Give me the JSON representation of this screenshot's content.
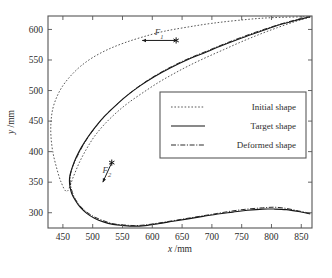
{
  "chart_data": {
    "type": "line",
    "title": "",
    "xlabel": "x /mm",
    "ylabel": "y /mm",
    "xlim": [
      425,
      868
    ],
    "ylim": [
      275,
      622
    ],
    "grid": false,
    "legend_position": "center-right",
    "xticks": [
      450,
      500,
      550,
      600,
      650,
      700,
      750,
      800,
      850
    ],
    "yticks": [
      300,
      350,
      400,
      450,
      500,
      550,
      600
    ],
    "xtick_labels": [
      "450",
      "500",
      "550",
      "600",
      "650",
      "700",
      "750",
      "800",
      "850"
    ],
    "ytick_labels": [
      "300",
      "350",
      "400",
      "450",
      "500",
      "550",
      "600"
    ],
    "series": [
      {
        "name": "Initial shape",
        "style": "dotted",
        "points": [
          [
            865,
            620
          ],
          [
            840,
            613
          ],
          [
            810,
            603
          ],
          [
            780,
            592
          ],
          [
            750,
            580
          ],
          [
            720,
            567
          ],
          [
            690,
            554
          ],
          [
            660,
            540
          ],
          [
            635,
            527
          ],
          [
            610,
            513
          ],
          [
            585,
            497
          ],
          [
            560,
            480
          ],
          [
            540,
            464
          ],
          [
            520,
            445
          ],
          [
            503,
            425
          ],
          [
            490,
            405
          ],
          [
            478,
            383
          ],
          [
            468,
            360
          ],
          [
            457,
            335
          ],
          [
            447,
            350
          ],
          [
            439,
            375
          ],
          [
            433,
            400
          ],
          [
            430,
            425
          ],
          [
            430,
            448
          ],
          [
            433,
            470
          ],
          [
            440,
            490
          ],
          [
            450,
            508
          ],
          [
            464,
            525
          ],
          [
            480,
            540
          ],
          [
            500,
            554
          ],
          [
            525,
            567
          ],
          [
            553,
            578
          ],
          [
            585,
            588
          ],
          [
            620,
            597
          ],
          [
            660,
            604
          ],
          [
            700,
            610
          ],
          [
            745,
            615
          ],
          [
            795,
            619
          ],
          [
            865,
            621
          ]
        ]
      },
      {
        "name": "Target shape",
        "style": "solid",
        "points": [
          [
            865,
            298
          ],
          [
            845,
            302
          ],
          [
            825,
            305
          ],
          [
            805,
            306
          ],
          [
            785,
            306
          ],
          [
            760,
            304
          ],
          [
            735,
            301
          ],
          [
            710,
            298
          ],
          [
            685,
            294
          ],
          [
            660,
            290
          ],
          [
            635,
            286
          ],
          [
            610,
            282
          ],
          [
            588,
            279
          ],
          [
            570,
            278
          ],
          [
            552,
            279
          ],
          [
            534,
            281
          ],
          [
            518,
            285
          ],
          [
            503,
            291
          ],
          [
            490,
            299
          ],
          [
            479,
            309
          ],
          [
            471,
            320
          ],
          [
            465,
            331
          ],
          [
            462,
            342
          ],
          [
            461,
            352
          ],
          [
            462,
            362
          ],
          [
            466,
            375
          ],
          [
            472,
            390
          ],
          [
            481,
            407
          ],
          [
            492,
            424
          ],
          [
            505,
            441
          ],
          [
            520,
            458
          ],
          [
            538,
            475
          ],
          [
            558,
            492
          ],
          [
            580,
            508
          ],
          [
            604,
            523
          ],
          [
            630,
            537
          ],
          [
            658,
            550
          ],
          [
            688,
            562
          ],
          [
            718,
            574
          ],
          [
            750,
            586
          ],
          [
            782,
            597
          ],
          [
            815,
            608
          ],
          [
            845,
            616
          ],
          [
            865,
            621
          ]
        ]
      },
      {
        "name": "Deformed shape",
        "style": "dashdot",
        "points": [
          [
            865,
            299
          ],
          [
            845,
            303
          ],
          [
            825,
            307
          ],
          [
            805,
            309
          ],
          [
            785,
            308
          ],
          [
            760,
            306
          ],
          [
            735,
            303
          ],
          [
            710,
            299
          ],
          [
            685,
            295
          ],
          [
            660,
            291
          ],
          [
            635,
            287
          ],
          [
            610,
            283
          ],
          [
            588,
            280
          ],
          [
            570,
            279
          ],
          [
            552,
            280
          ],
          [
            534,
            282
          ],
          [
            518,
            287
          ],
          [
            503,
            293
          ],
          [
            490,
            301
          ],
          [
            479,
            311
          ],
          [
            471,
            322
          ],
          [
            466,
            333
          ],
          [
            463,
            344
          ],
          [
            462,
            354
          ],
          [
            463,
            364
          ],
          [
            467,
            377
          ],
          [
            474,
            392
          ],
          [
            483,
            409
          ],
          [
            494,
            426
          ],
          [
            507,
            443
          ],
          [
            522,
            460
          ],
          [
            540,
            477
          ],
          [
            560,
            494
          ],
          [
            582,
            510
          ],
          [
            606,
            525
          ],
          [
            632,
            539
          ],
          [
            660,
            552
          ],
          [
            690,
            564
          ],
          [
            720,
            576
          ],
          [
            752,
            588
          ],
          [
            784,
            599
          ],
          [
            816,
            609
          ],
          [
            846,
            617
          ],
          [
            865,
            621
          ]
        ]
      }
    ],
    "annotations": [
      {
        "label": "F1",
        "label_sub": "1",
        "marker_x": 640,
        "marker_y": 582,
        "arrow_to_x": 583,
        "arrow_to_y": 582,
        "marker": "star"
      },
      {
        "label": "F2",
        "label_sub": "2",
        "marker_x": 532,
        "marker_y": 382,
        "arrow_to_x": 517,
        "arrow_to_y": 350,
        "marker": "star"
      }
    ]
  },
  "legend": {
    "items": [
      {
        "label": "Initial shape",
        "style": "dotted"
      },
      {
        "label": "Target shape",
        "style": "solid"
      },
      {
        "label": "Deformed shape",
        "style": "dashdot"
      }
    ]
  },
  "axes": {
    "x_title_var": "x",
    "x_title_unit": " /mm",
    "y_title_var": "y",
    "y_title_unit": " /mm"
  },
  "colors": {
    "axis": "#555555",
    "initial": "#3a3a3a",
    "target": "#151515",
    "deformed": "#202020",
    "text": "#2b2b2b",
    "background": "#ffffff"
  }
}
